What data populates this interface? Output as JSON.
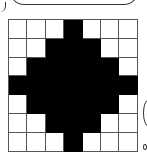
{
  "diagram": {
    "type": "pixel-grid",
    "rows": 7,
    "cols": 7,
    "colors": {
      "filled": "#000000",
      "empty": "#ffffff",
      "grid_line": "#555555"
    },
    "cells": [
      [
        0,
        0,
        0,
        1,
        0,
        0,
        0
      ],
      [
        0,
        0,
        1,
        1,
        1,
        0,
        0
      ],
      [
        0,
        1,
        1,
        1,
        1,
        1,
        0
      ],
      [
        1,
        1,
        1,
        1,
        1,
        1,
        1
      ],
      [
        0,
        1,
        1,
        1,
        1,
        1,
        0
      ],
      [
        0,
        0,
        1,
        1,
        1,
        0,
        0
      ],
      [
        0,
        0,
        0,
        1,
        0,
        0,
        0
      ]
    ]
  }
}
